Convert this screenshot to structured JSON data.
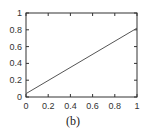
{
  "chart_data": {
    "type": "line",
    "title": "",
    "caption": "(b)",
    "xlabel": "",
    "ylabel": "",
    "xlim": [
      0,
      1
    ],
    "ylim": [
      0,
      1
    ],
    "x_ticks": [
      "0",
      "0.2",
      "0.4",
      "0.6",
      "0.8",
      "1"
    ],
    "y_ticks": [
      "0",
      "0.2",
      "0.4",
      "0.6",
      "0.8",
      "1"
    ],
    "grid": false,
    "legend": [],
    "series": [
      {
        "name": "line",
        "x": [
          0,
          1
        ],
        "y": [
          0.04,
          0.82
        ],
        "color": "#555555"
      }
    ]
  }
}
